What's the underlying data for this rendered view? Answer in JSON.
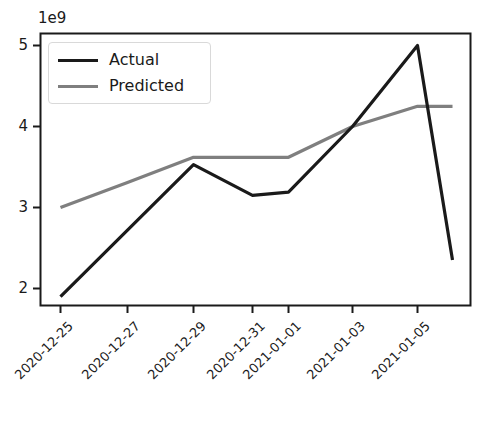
{
  "chart_data": {
    "type": "line",
    "title": "",
    "xlabel": "",
    "ylabel": "",
    "y_offset_text": "1e9",
    "grid": false,
    "legend_position": "upper left",
    "x_categories": [
      "2020-12-25",
      "2020-12-27",
      "2020-12-29",
      "2020-12-31",
      "2021-01-01",
      "2021-01-03",
      "2021-01-05"
    ],
    "x_tick_labels": [
      "2020-12-25",
      "2020-12-27",
      "2020-12-29",
      "2020-12-31",
      "2021-01-01",
      "2021-01-03",
      "2021-01-05"
    ],
    "y_tick_labels": [
      "2",
      "3",
      "4",
      "5"
    ],
    "y_ticks": [
      2000000000,
      3000000000,
      4000000000,
      5000000000
    ],
    "ylim": [
      1650000000,
      5350000000
    ],
    "series": [
      {
        "name": "Actual",
        "color": "#1a1a1a",
        "x": [
          "2020-12-25",
          "2020-12-27",
          "2020-12-29",
          "2020-12-31",
          "2021-01-01",
          "2021-01-03",
          "2021-01-05",
          "2021-01-06"
        ],
        "values": [
          1900000000,
          2720000000,
          3530000000,
          3150000000,
          3190000000,
          4000000000,
          5000000000,
          2350000000
        ]
      },
      {
        "name": "Predicted",
        "color": "#7f7f7f",
        "x": [
          "2020-12-25",
          "2020-12-27",
          "2020-12-29",
          "2020-12-31",
          "2021-01-01",
          "2021-01-03",
          "2021-01-05",
          "2021-01-06"
        ],
        "values": [
          3000000000,
          3310000000,
          3620000000,
          3620000000,
          3620000000,
          4000000000,
          4250000000,
          4250000000
        ]
      }
    ]
  },
  "legend": {
    "entries": [
      {
        "label": "Actual"
      },
      {
        "label": "Predicted"
      }
    ]
  },
  "colors": {
    "actual": "#1a1a1a",
    "predicted": "#7f7f7f",
    "axis": "#1a1a1a",
    "legend_border": "#d9d9d9",
    "background": "#ffffff"
  }
}
